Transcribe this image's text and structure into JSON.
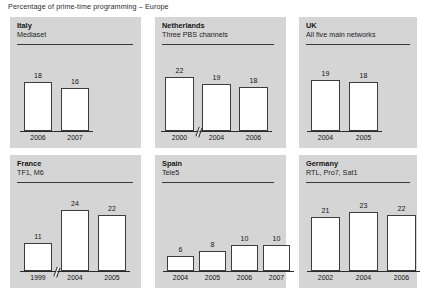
{
  "chart_data": {
    "type": "bar",
    "title": "Percentage of prime-time programming – Europe",
    "xlabel": "",
    "ylabel": "",
    "grid": false,
    "legend": "none",
    "value_unit": "percent",
    "panels": [
      {
        "country": "Italy",
        "channels": "Mediaset",
        "categories": [
          "2006",
          "2007"
        ],
        "values": [
          18,
          16
        ],
        "axis_break_after_index": null
      },
      {
        "country": "Netherlands",
        "channels": "Three PBS channels",
        "categories": [
          "2000",
          "2004",
          "2006"
        ],
        "values": [
          22,
          19,
          18
        ],
        "axis_break_after_index": 0
      },
      {
        "country": "UK",
        "channels": "All five main networks",
        "categories": [
          "2004",
          "2005"
        ],
        "values": [
          19,
          18
        ],
        "axis_break_after_index": null
      },
      {
        "country": "France",
        "channels": "TF1, M6",
        "categories": [
          "1999",
          "2004",
          "2005"
        ],
        "values": [
          11,
          24,
          22
        ],
        "axis_break_after_index": 0
      },
      {
        "country": "Spain",
        "channels": "Tele5",
        "categories": [
          "2004",
          "2005",
          "2006",
          "2007"
        ],
        "values": [
          6,
          8,
          10,
          10
        ],
        "axis_break_after_index": null
      },
      {
        "country": "Germany",
        "channels": "RTL, Pro7, Sat1",
        "categories": [
          "2002",
          "2004",
          "2006"
        ],
        "values": [
          21,
          23,
          22
        ],
        "axis_break_after_index": null
      }
    ]
  },
  "colors": {
    "panel_background": "#d5d5d5",
    "page_background": "#ffffff",
    "bar_fill": "#ffffff",
    "bar_outline": "#3c3c3c",
    "text": "#141414"
  }
}
